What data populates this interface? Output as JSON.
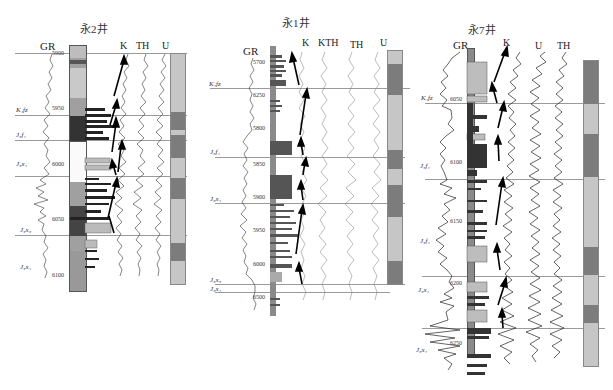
{
  "colors": {
    "light_bar": "#c6c6c6",
    "dark_bar": "#7c7c7c",
    "mid_bar": "#9a9a9a",
    "horizon_line": "#999999",
    "curve": "#333333",
    "arrow": "#000000"
  },
  "wells": [
    {
      "id": "yong2",
      "title": "永2井",
      "curve_labels": {
        "gr": "GR",
        "k": "K",
        "th": "TH",
        "u": "U"
      },
      "depth_ticks": [
        "5900",
        "5950",
        "6000",
        "6050",
        "6100"
      ],
      "horizons": [
        {
          "label": "K₁fz",
          "y": 115
        },
        {
          "label": "J₃f₁",
          "y": 140
        },
        {
          "label": "J₃x₁",
          "y": 176
        },
        {
          "label": "J₃x₃",
          "y": 235
        },
        {
          "label": "J₃x₁",
          "y": 268
        }
      ],
      "cycle_bar": [
        {
          "state": "light",
          "pct": 25
        },
        {
          "state": "dark",
          "pct": 8
        },
        {
          "state": "light",
          "pct": 2
        },
        {
          "state": "dark",
          "pct": 10
        },
        {
          "state": "light",
          "pct": 9
        },
        {
          "state": "dark",
          "pct": 9
        },
        {
          "state": "light",
          "pct": 19
        },
        {
          "state": "dark",
          "pct": 8
        },
        {
          "state": "light",
          "pct": 10
        }
      ]
    },
    {
      "id": "yong1",
      "title": "永1井",
      "curve_labels": {
        "gr": "GR",
        "k": "K",
        "kth": "KTH",
        "th": "TH",
        "u": "U"
      },
      "depth_ticks": [
        "5700",
        "6250",
        "5800",
        "5850",
        "5900",
        "5950",
        "6000",
        "6500"
      ],
      "horizons": [
        {
          "label": "K₁fz",
          "y": 88
        },
        {
          "label": "J₃f₁",
          "y": 157
        },
        {
          "label": "J₃x₁",
          "y": 203
        },
        {
          "label": "J₃x₃",
          "y": 284
        },
        {
          "label": "J₃x₁",
          "y": 292
        }
      ],
      "cycle_bar": [
        {
          "state": "light",
          "pct": 6
        },
        {
          "state": "dark",
          "pct": 15
        },
        {
          "state": "light",
          "pct": 26
        },
        {
          "state": "dark",
          "pct": 9
        },
        {
          "state": "light",
          "pct": 8
        },
        {
          "state": "dark",
          "pct": 15
        },
        {
          "state": "light",
          "pct": 21
        },
        {
          "state": "dark",
          "pct": 11
        }
      ]
    },
    {
      "id": "yong7",
      "title": "永7井",
      "curve_labels": {
        "gr": "GR",
        "k": "K",
        "u": "U",
        "th": "TH"
      },
      "depth_ticks": [
        "6050",
        "6100",
        "6150",
        "6200",
        "6250"
      ],
      "horizons": [
        {
          "label": "K₁fz",
          "y": 103
        },
        {
          "label": "J₃f₁",
          "y": 162
        },
        {
          "label": "J₃f₁",
          "y": 240
        },
        {
          "label": "J₃x₁",
          "y": 276
        },
        {
          "label": "J₃x₁",
          "y": 328
        }
      ],
      "cycle_bar": [
        {
          "state": "dark",
          "pct": 14
        },
        {
          "state": "light",
          "pct": 10
        },
        {
          "state": "dark",
          "pct": 14
        },
        {
          "state": "light",
          "pct": 23
        },
        {
          "state": "dark",
          "pct": 9
        },
        {
          "state": "light",
          "pct": 10
        },
        {
          "state": "dark",
          "pct": 6
        },
        {
          "state": "light",
          "pct": 14
        }
      ]
    }
  ]
}
